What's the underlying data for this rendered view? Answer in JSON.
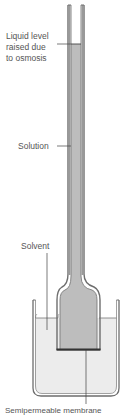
{
  "diagram": {
    "labels": {
      "liquid_level_line1": "Liquid level",
      "liquid_level_line2": "raised due",
      "liquid_level_line3": "to osmosis",
      "solution": "Solution",
      "solvent": "Solvent",
      "membrane": "Semipermeable membrane"
    },
    "colors": {
      "glass": "#6e6e6e",
      "solution": "#bdbdbd",
      "solvent": "#ececec",
      "text": "#555555",
      "leader": "#444444"
    }
  }
}
